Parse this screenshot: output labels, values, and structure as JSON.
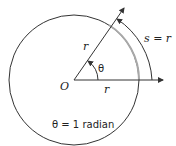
{
  "diagram": {
    "labels": {
      "origin": "O",
      "radius_top": "r",
      "radius_bottom": "r",
      "angle": "θ",
      "arc": "s = r",
      "caption": "θ = 1 radian"
    },
    "colors": {
      "line": "#333333",
      "arc_highlight": "#a8a8a8"
    }
  }
}
